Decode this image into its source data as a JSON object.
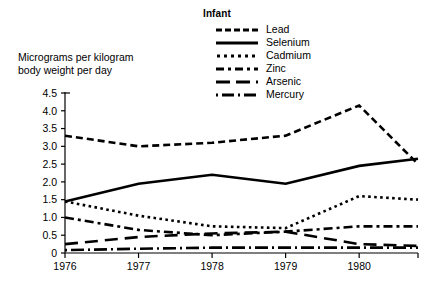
{
  "chart_data": {
    "type": "line",
    "title": "Infant",
    "ylabel": "Micrograms per kilogram body weight per day",
    "xlabel": "",
    "ylim": [
      0,
      4.5
    ],
    "xlim": [
      1976,
      1980.8
    ],
    "grid": false,
    "legend_position": "top-center",
    "ytick_labels": [
      "0",
      "0.5",
      "1.0",
      "1.5",
      "2.0",
      "2.5",
      "3.0",
      "3.5",
      "4.0",
      "4.5"
    ],
    "ytick_values": [
      0,
      0.5,
      1.0,
      1.5,
      2.0,
      2.5,
      3.0,
      3.5,
      4.0,
      4.5
    ],
    "xtick_labels": [
      "1976",
      "1977",
      "1978",
      "1979",
      "1980"
    ],
    "xtick_values": [
      1976,
      1977,
      1978,
      1979,
      1980
    ],
    "x": [
      1976,
      1977,
      1978,
      1979,
      1980,
      1980.8
    ],
    "series": [
      {
        "name": "Lead",
        "dash": "dashed",
        "values": [
          3.3,
          3.0,
          3.1,
          3.3,
          4.15,
          2.5
        ]
      },
      {
        "name": "Selenium",
        "dash": "solid",
        "values": [
          1.45,
          1.95,
          2.2,
          1.95,
          2.45,
          2.65
        ]
      },
      {
        "name": "Cadmium",
        "dash": "dotted",
        "values": [
          1.45,
          1.05,
          0.75,
          0.7,
          1.6,
          1.5
        ]
      },
      {
        "name": "Zinc",
        "dash": "dashdot",
        "values": [
          1.0,
          0.65,
          0.5,
          0.6,
          0.75,
          0.75
        ]
      },
      {
        "name": "Arsenic",
        "dash": "longdash",
        "values": [
          0.25,
          0.45,
          0.55,
          0.6,
          0.25,
          0.2
        ]
      },
      {
        "name": "Mercury",
        "dash": "dashdotlong",
        "values": [
          0.08,
          0.12,
          0.15,
          0.15,
          0.15,
          0.15
        ]
      }
    ]
  },
  "legend": {
    "title": "Infant",
    "items": [
      {
        "label": "Lead"
      },
      {
        "label": "Selenium"
      },
      {
        "label": "Cadmium"
      },
      {
        "label": "Zinc"
      },
      {
        "label": "Arsenic"
      },
      {
        "label": "Mercury"
      }
    ]
  },
  "axis": {
    "y_caption_line1": "Micrograms per kilogram",
    "y_caption_line2": "body weight per day"
  },
  "colors": {
    "ink": "#000000",
    "background": "#ffffff"
  }
}
